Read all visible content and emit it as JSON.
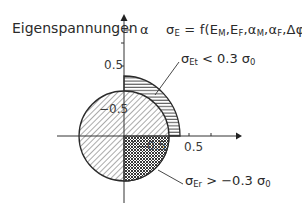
{
  "diagram": {
    "title": "Eigenspannungen",
    "axis_symbol": "α",
    "formula": {
      "lhs": "σ",
      "lhs_sub": "E",
      "rhs": "= f(E",
      "args": "M",
      "full_text": "σE = f(EM,EF,αM,αF,Δφ)"
    },
    "formula_parts": [
      "σ",
      "E",
      " = f(E",
      "M",
      ",E",
      "F",
      ",α",
      "M",
      ",α",
      "F",
      ",Δφ)"
    ],
    "annotations": {
      "tangential": {
        "sigma": "σ",
        "sub": "Et",
        "rest": " < 0.3 σ",
        "sub2": "0",
        "full_text": "σEt < 0.3 σ0"
      },
      "radial": {
        "sigma": "σ",
        "sub": "Er",
        "rest": " > −0.3 σ",
        "sub2": "0",
        "full_text": "σEr > −0.3 σ0"
      }
    },
    "tick_labels": {
      "vertical_pos": "0.5",
      "vertical_neg": "−0.5",
      "horizontal_pos": "0.5",
      "horizontal_neg": "−0.5"
    },
    "regions": [
      {
        "name": "inner-circle",
        "pattern": "diagonal-hatch",
        "description": "full circle, radius ≈0.32"
      },
      {
        "name": "outer-quarter-ring",
        "pattern": "horizontal-hatch",
        "quadrant": "upper-right"
      },
      {
        "name": "lower-right-quadrant",
        "pattern": "cross-hatch",
        "quadrant": "lower-right"
      }
    ],
    "colors": {
      "line": "#2a2a2a",
      "background": "#ffffff"
    }
  }
}
